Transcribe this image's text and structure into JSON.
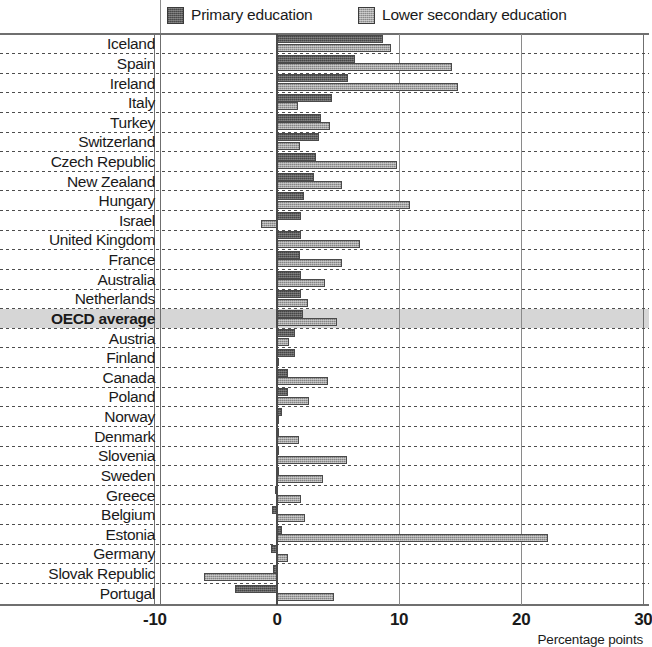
{
  "legend": {
    "primary_label": "Primary education",
    "lower_label": "Lower secondary education",
    "primary_color": "#5d5d5d",
    "lower_color": "#a5a5a5"
  },
  "axis": {
    "title": "Percentage points",
    "ticks": [
      "-10",
      "0",
      "10",
      "20",
      "30"
    ]
  },
  "highlight_row": "OECD average",
  "chart_data": {
    "type": "bar",
    "orientation": "horizontal",
    "title": "",
    "subtitle": "",
    "xlabel": "Percentage points",
    "ylabel": "",
    "xlim": [
      -10,
      30
    ],
    "xticks": [
      -10,
      0,
      10,
      20,
      30
    ],
    "grid": true,
    "legend_position": "top",
    "highlight_category": "OECD average",
    "categories": [
      "Iceland",
      "Spain",
      "Ireland",
      "Italy",
      "Turkey",
      "Switzerland",
      "Czech Republic",
      "New Zealand",
      "Hungary",
      "Israel",
      "United Kingdom",
      "France",
      "Australia",
      "Netherlands",
      "OECD average",
      "Austria",
      "Finland",
      "Canada",
      "Poland",
      "Norway",
      "Denmark",
      "Slovenia",
      "Sweden",
      "Greece",
      "Belgium",
      "Estonia",
      "Germany",
      "Slovak Republic",
      "Portugal"
    ],
    "series": [
      {
        "name": "Primary education",
        "color": "#5d5d5d",
        "values": [
          8.7,
          6.4,
          5.8,
          4.5,
          3.6,
          3.4,
          3.2,
          3.0,
          2.2,
          2.0,
          2.0,
          1.9,
          2.0,
          2.0,
          2.1,
          1.5,
          1.5,
          0.9,
          0.9,
          0.4,
          0.2,
          0.2,
          0.1,
          -0.2,
          -0.4,
          0.4,
          -0.5,
          -0.3,
          -3.4
        ]
      },
      {
        "name": "Lower secondary education",
        "color": "#a5a5a5",
        "values": [
          9.3,
          14.3,
          14.8,
          1.7,
          4.3,
          1.9,
          9.8,
          5.3,
          10.9,
          -1.3,
          6.8,
          5.3,
          3.9,
          2.5,
          4.9,
          1.0,
          0.0,
          4.2,
          2.6,
          0.2,
          1.8,
          5.7,
          3.8,
          2.0,
          2.3,
          22.2,
          0.9,
          -6.0,
          4.7
        ]
      }
    ]
  }
}
